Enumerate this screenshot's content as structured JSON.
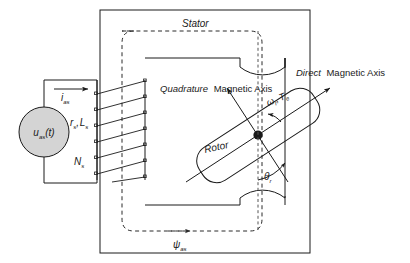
{
  "figure": {
    "type": "schematic-diagram",
    "colors": {
      "line": "#1a1a1a",
      "background": "#ffffff",
      "source_fill": "#d4d4d4",
      "dashed_flux": "#2b2b2b"
    }
  },
  "labels": {
    "stator": "Stator",
    "rotor": "Rotor",
    "quadrature_italic": "Quadrature",
    "quadrature_rest": "Magnetic Axis",
    "direct_italic": "Direct",
    "direct_rest": "Magnetic Axis",
    "source": "u",
    "source_sub": "as",
    "source_arg": "(t)",
    "current": "i",
    "current_sub": "as",
    "resistance": "r",
    "resistance_sub": "s",
    "inductance": "L",
    "inductance_sub": "s",
    "rs_ls": "rₛ,Lₛ",
    "turns": "N",
    "turns_sub": "s",
    "flux": "ψ",
    "flux_sub": "as",
    "speed": "ω",
    "speed_sub": "r",
    "torque": "T",
    "torque_sub": "e",
    "speed_torque_sep": ",",
    "angle": "θ",
    "angle_sub": "r"
  }
}
